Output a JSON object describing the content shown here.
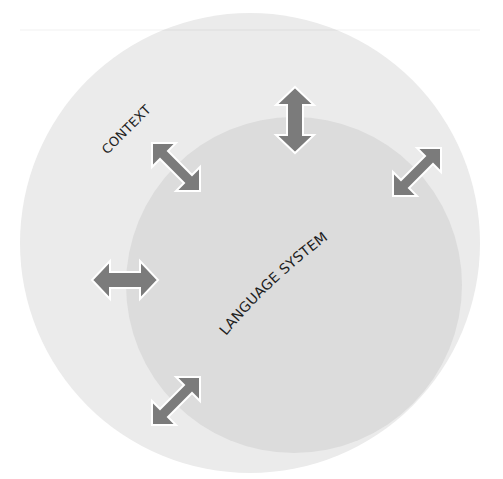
{
  "diagram": {
    "outer_circle": {
      "label": "CONTEXT",
      "cx": 250,
      "cy": 243,
      "r": 230,
      "fill": "#ebebeb"
    },
    "inner_circle": {
      "label": "LANGUAGE SYSTEM",
      "cx": 294,
      "cy": 285,
      "r": 168,
      "fill": "#dcdcdc"
    },
    "arrow_color": "#7b7b7b",
    "arrow_outline": "#ffffff",
    "arrows": [
      {
        "name": "diagonal-nw-se",
        "cx": 176,
        "cy": 167,
        "rotate": 45
      },
      {
        "name": "vertical",
        "cx": 295,
        "cy": 120,
        "rotate": 90
      },
      {
        "name": "diagonal-ne-sw",
        "cx": 417,
        "cy": 172,
        "rotate": -45
      },
      {
        "name": "horizontal",
        "cx": 125,
        "cy": 280,
        "rotate": 0
      },
      {
        "name": "diagonal-ne-sw-bottom",
        "cx": 176,
        "cy": 401,
        "rotate": -45
      }
    ]
  }
}
